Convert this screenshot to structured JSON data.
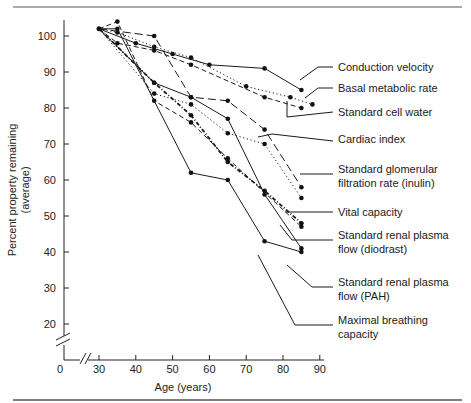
{
  "chart_data": {
    "type": "line",
    "title": "",
    "xlabel": "Age (years)",
    "ylabel": "Percent property remaining (average)",
    "ylabel_lines": [
      "Percent property remaining",
      "(average)"
    ],
    "x_ticks": [
      30,
      40,
      50,
      60,
      70,
      80,
      90
    ],
    "y_ticks": [
      20,
      30,
      40,
      50,
      60,
      70,
      80,
      90,
      100
    ],
    "x_origin_label": "0",
    "xlim": [
      0,
      90
    ],
    "ylim": [
      0,
      105
    ],
    "grid": false,
    "legend_position": "right, leader-line labels",
    "axis_breaks": [
      "x between 0 and 30",
      "y between 0 and 20"
    ],
    "series": [
      {
        "name": "Conduction velocity",
        "style": "solid",
        "x": [
          30,
          40,
          50,
          60,
          75,
          85
        ],
        "y": [
          102,
          98,
          95,
          92,
          91,
          85
        ]
      },
      {
        "name": "Basal metabolic rate",
        "style": "dotted",
        "x": [
          30,
          35,
          45,
          55,
          70,
          82,
          88
        ],
        "y": [
          102,
          101,
          97,
          94,
          86,
          83,
          81
        ]
      },
      {
        "name": "Standard cell water",
        "style": "dash",
        "x": [
          30,
          35,
          45,
          55,
          75,
          85
        ],
        "y": [
          102,
          98,
          96,
          92,
          83,
          80
        ]
      },
      {
        "name": "Cardiac index",
        "style": "solid",
        "x": [
          30,
          45,
          55,
          65,
          75,
          85
        ],
        "y": [
          102,
          87,
          83,
          77,
          56,
          41
        ]
      },
      {
        "name": "Standard glomerular filtration rate (inulin)",
        "style": "dotted",
        "x": [
          30,
          45,
          55,
          65,
          75,
          85
        ],
        "y": [
          102,
          84,
          81,
          73,
          70,
          55
        ]
      },
      {
        "name": "Vital capacity",
        "style": "long-dash",
        "x": [
          30,
          45,
          55,
          65,
          75,
          85
        ],
        "y": [
          102,
          100,
          83,
          82,
          74,
          58
        ]
      },
      {
        "name": "Standard renal plasma flow (diodrast)",
        "style": "dash-double",
        "x": [
          30,
          45,
          55,
          65,
          75,
          85
        ],
        "y": [
          102,
          87,
          78,
          65,
          57,
          48
        ]
      },
      {
        "name": "Standard renal plasma flow (PAH)",
        "style": "dash",
        "x": [
          30,
          35,
          45,
          55,
          65,
          85
        ],
        "y": [
          102,
          104,
          82,
          76,
          66,
          47
        ]
      },
      {
        "name": "Maximal breathing capacity",
        "style": "solid",
        "x": [
          30,
          35,
          55,
          65,
          75,
          85
        ],
        "y": [
          102,
          102,
          62,
          60,
          43,
          40
        ]
      }
    ]
  },
  "labels": {
    "x_axis_title": "Age (years)",
    "y_axis_title_line1": "Percent property remaining",
    "y_axis_title_line2": "(average)",
    "origin": "0",
    "series": [
      {
        "line1": "Conduction velocity",
        "line2": ""
      },
      {
        "line1": "Basal metabolic rate",
        "line2": ""
      },
      {
        "line1": "Standard cell water",
        "line2": ""
      },
      {
        "line1": "Cardiac index",
        "line2": ""
      },
      {
        "line1": "Standard glomerular",
        "line2": "filtration rate (inulin)"
      },
      {
        "line1": "Vital capacity",
        "line2": ""
      },
      {
        "line1": "Standard renal plasma",
        "line2": "flow (diodrast)"
      },
      {
        "line1": "Standard renal plasma",
        "line2": "flow (PAH)"
      },
      {
        "line1": "Maximal breathing",
        "line2": "capacity"
      }
    ]
  },
  "colors": {
    "ink": "#1a1a1a",
    "background": "#ffffff",
    "rule": "#555555"
  }
}
